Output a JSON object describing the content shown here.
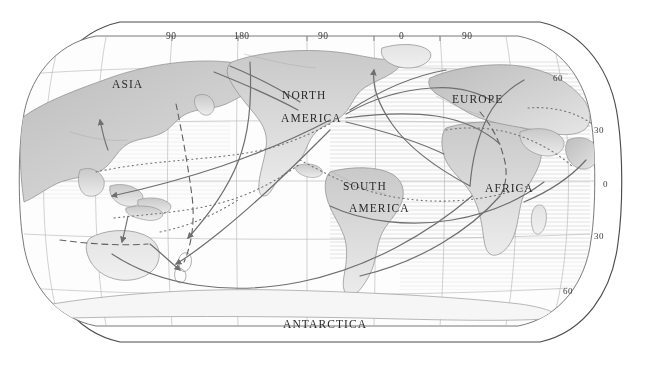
{
  "map": {
    "title": "World map with human migration routes",
    "projection": "Robinson-style oval world projection",
    "background_color": "#ffffff",
    "ink_color": "#555555",
    "land_fill": "#d8d8d8",
    "ocean_fill": "#fbfbfb",
    "continent_labels": [
      {
        "name": "asia",
        "text": "ASIA",
        "x": 112,
        "y": 78
      },
      {
        "name": "north-america-line1",
        "text": "NORTH",
        "x": 282,
        "y": 89
      },
      {
        "name": "north-america-line2",
        "text": "AMERICA",
        "x": 281,
        "y": 112
      },
      {
        "name": "europe",
        "text": "EUROPE",
        "x": 452,
        "y": 93
      },
      {
        "name": "south-america-line1",
        "text": "SOUTH",
        "x": 343,
        "y": 180
      },
      {
        "name": "south-america-line2",
        "text": "AMERICA",
        "x": 349,
        "y": 202
      },
      {
        "name": "africa",
        "text": "AFRICA",
        "x": 485,
        "y": 182
      },
      {
        "name": "antarctica",
        "text": "ANTARCTICA",
        "x": 283,
        "y": 318
      }
    ],
    "longitude_labels": [
      {
        "name": "lon-90w-left",
        "text": "90",
        "x": 166,
        "y": 31
      },
      {
        "name": "lon-180",
        "text": "180",
        "x": 234,
        "y": 31
      },
      {
        "name": "lon-90e",
        "text": "90",
        "x": 318,
        "y": 31
      },
      {
        "name": "lon-0",
        "text": "0",
        "x": 399,
        "y": 31
      },
      {
        "name": "lon-90w-right",
        "text": "90",
        "x": 462,
        "y": 31
      }
    ],
    "latitude_labels": [
      {
        "name": "lat-60n",
        "text": "60",
        "x": 553,
        "y": 73
      },
      {
        "name": "lat-30n",
        "text": "30",
        "x": 594,
        "y": 125
      },
      {
        "name": "lat-0",
        "text": "0",
        "x": 603,
        "y": 179
      },
      {
        "name": "lat-30s",
        "text": "30",
        "x": 594,
        "y": 231
      },
      {
        "name": "lat-60s",
        "text": "60",
        "x": 563,
        "y": 286
      }
    ],
    "route_styles": {
      "solid": "solid migration route with arrowheads",
      "dashed": "dashed migration route",
      "dotted": "dotted migration route"
    }
  }
}
